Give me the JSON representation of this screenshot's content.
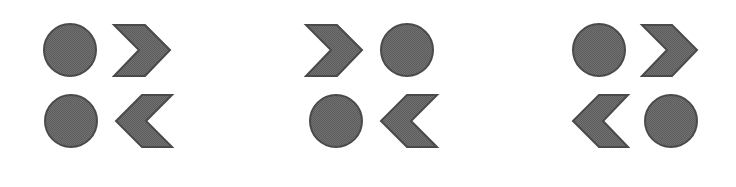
{
  "figure": {
    "colors": {
      "fill": "#6b6b6b",
      "fill_dither": "#5a5a5a",
      "stroke": "#4a4a4a",
      "background": "#ffffff"
    },
    "panels": [
      {
        "id": "panel-1",
        "top_row": [
          "circle",
          "chevron-right"
        ],
        "bottom_row": [
          "circle",
          "chevron-left"
        ]
      },
      {
        "id": "panel-2",
        "top_row": [
          "chevron-right",
          "circle"
        ],
        "bottom_row": [
          "circle",
          "chevron-left"
        ]
      },
      {
        "id": "panel-3",
        "top_row": [
          "circle",
          "chevron-right"
        ],
        "bottom_row": [
          "chevron-left",
          "circle"
        ]
      }
    ]
  }
}
